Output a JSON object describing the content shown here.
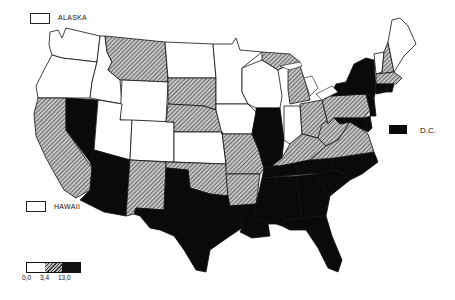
{
  "map": {
    "title": "",
    "type": "choropleth",
    "legend": {
      "categories": [
        {
          "key": "low",
          "label": "0,0",
          "pattern": "white",
          "color": "#ffffff"
        },
        {
          "key": "mid",
          "label": "3,4",
          "pattern": "hatched",
          "color": "#888888"
        },
        {
          "key": "high",
          "label": "13,0",
          "pattern": "black",
          "color": "#0a0a0a"
        }
      ]
    },
    "insets": {
      "alaska": {
        "label": "ALASKA",
        "category": "low"
      },
      "hawaii": {
        "label": "HAWAII",
        "category": "low"
      },
      "dc": {
        "label": "D.C.",
        "category": "high"
      }
    },
    "states": {
      "WA": "low",
      "OR": "low",
      "ID": "low",
      "MT": "mid",
      "WY": "low",
      "CA": "mid",
      "NV": "high",
      "UT": "low",
      "CO": "low",
      "AZ": "high",
      "NM": "mid",
      "ND": "low",
      "SD": "mid",
      "NE": "mid",
      "KS": "low",
      "OK": "mid",
      "TX": "high",
      "MN": "low",
      "IA": "low",
      "MO": "mid",
      "AR": "mid",
      "LA": "high",
      "WI": "low",
      "IL": "high",
      "MI": "mid",
      "IN": "low",
      "OH": "mid",
      "KY": "mid",
      "TN": "high",
      "MS": "high",
      "AL": "high",
      "GA": "high",
      "FL": "high",
      "SC": "high",
      "NC": "high",
      "VA": "mid",
      "WV": "mid",
      "PA": "mid",
      "NY": "high",
      "VT": "low",
      "NH": "mid",
      "ME": "low",
      "MA": "mid",
      "RI": "high",
      "CT": "high",
      "NJ": "high",
      "DE": "high",
      "MD": "high"
    }
  }
}
